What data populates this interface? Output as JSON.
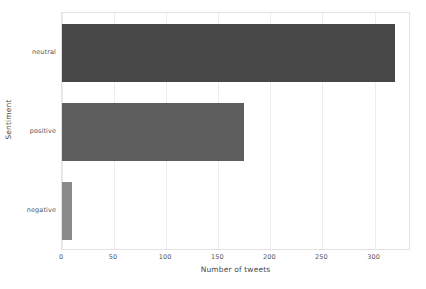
{
  "chart_data": {
    "type": "bar",
    "orientation": "horizontal",
    "title": "",
    "xlabel": "Number of tweets",
    "ylabel": "Sentiment",
    "categories": [
      "negative",
      "positive",
      "neutral"
    ],
    "values": [
      10,
      175,
      320
    ],
    "series": [
      {
        "name": "Number of tweets",
        "values": [
          10,
          175,
          320
        ]
      }
    ],
    "bars": [
      {
        "category": "neutral",
        "value": 320,
        "color": "#474747"
      },
      {
        "category": "positive",
        "value": 175,
        "color": "#5e5e5e"
      },
      {
        "category": "negative",
        "value": 10,
        "color": "#8a8a8a"
      }
    ],
    "xlim": [
      0,
      335
    ],
    "xticks": [
      0,
      50,
      100,
      150,
      200,
      250,
      300
    ],
    "xtick_labels": [
      "0",
      "50",
      "100",
      "150",
      "200",
      "250",
      "300"
    ],
    "ytick_labels": [
      "neutral",
      "positive",
      "negative"
    ],
    "grid": true,
    "grid_axis": "x",
    "grid_color": "#ededed",
    "legend": false,
    "background": "#ffffff",
    "axes_border_color": "#e2e2e2"
  }
}
